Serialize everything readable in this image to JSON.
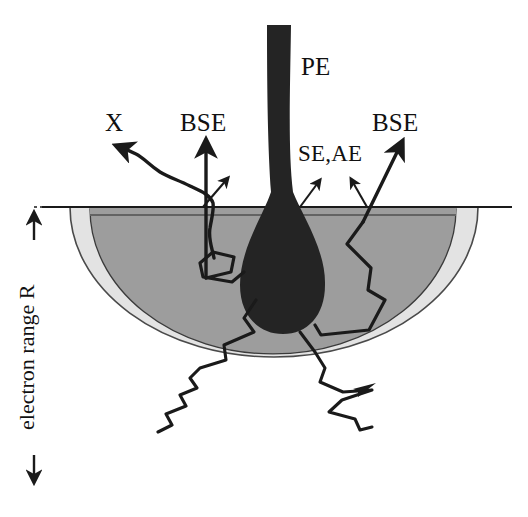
{
  "figure": {
    "labels": {
      "primary_electrons": "PE",
      "xray": "X",
      "backscattered_left": "BSE",
      "backscattered_right": "BSE",
      "secondary_auger": "SE,AE",
      "electron_range": "electron range R"
    },
    "colors": {
      "background": "#ffffff",
      "outline": "#1a1a1a",
      "beam_fill": "#242424",
      "bse_region_fill": "#9d9d9d",
      "electron_range_fill": "#e3e3e3",
      "surface_line": "#1a1a1a",
      "trajectory": "#1a1a1a"
    },
    "regions": [
      {
        "name": "electron-range-volume",
        "shade": "light-gray",
        "shape": "circle-below-surface"
      },
      {
        "name": "bse-region",
        "shade": "dark-gray",
        "shape": "dome-below-surface"
      },
      {
        "name": "beam-interaction-teardrop",
        "shade": "black",
        "shape": "teardrop"
      }
    ],
    "signals": [
      {
        "name": "PE",
        "description": "primary electron beam entering from top"
      },
      {
        "name": "X",
        "description": "characteristic x-ray escaping to upper left"
      },
      {
        "name": "BSE",
        "description": "backscattered electrons escaping surface"
      },
      {
        "name": "SE,AE",
        "description": "secondary and Auger electrons from near surface"
      }
    ]
  }
}
